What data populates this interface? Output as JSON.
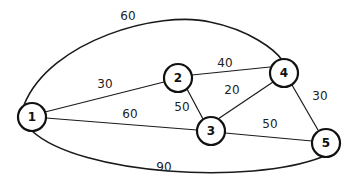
{
  "diagram": {
    "type": "weighted-undirected-graph",
    "nodes": [
      {
        "id": "1",
        "label": "1",
        "x": 32,
        "y": 117
      },
      {
        "id": "2",
        "label": "2",
        "x": 178,
        "y": 78
      },
      {
        "id": "3",
        "label": "3",
        "x": 211,
        "y": 131
      },
      {
        "id": "4",
        "label": "4",
        "x": 284,
        "y": 73
      },
      {
        "id": "5",
        "label": "5",
        "x": 326,
        "y": 143
      }
    ],
    "edges": [
      {
        "from": "1",
        "to": "2",
        "weight": "30"
      },
      {
        "from": "1",
        "to": "3",
        "weight": "60"
      },
      {
        "from": "1",
        "to": "4",
        "weight": "60"
      },
      {
        "from": "1",
        "to": "5",
        "weight": "90"
      },
      {
        "from": "2",
        "to": "4",
        "weight": "40"
      },
      {
        "from": "2",
        "to": "3",
        "weight": "50"
      },
      {
        "from": "3",
        "to": "4",
        "weight": "20"
      },
      {
        "from": "3",
        "to": "5",
        "weight": "50"
      },
      {
        "from": "4",
        "to": "5",
        "weight": "30"
      }
    ]
  }
}
